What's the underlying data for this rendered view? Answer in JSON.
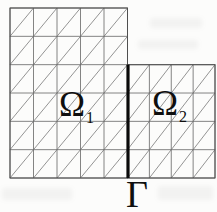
{
  "figure": {
    "canvas": {
      "width": 217,
      "height": 212
    },
    "colors": {
      "background": "#fcfcfb",
      "grid_line": "#646464",
      "diagonal_line": "#707070",
      "region_border": "#4f4f4f",
      "interface_line": "#0a0a0a",
      "label_text": "#0f0f0f"
    },
    "regions": [
      {
        "id": "omega1-mesh",
        "x": 10,
        "y": 8,
        "width": 117.5,
        "height": 170,
        "cols": 5,
        "rows": 6,
        "diagonal": "bl-tr"
      },
      {
        "id": "omega2-mesh",
        "x": 127.5,
        "y": 64.7,
        "width": 87.5,
        "height": 113.3,
        "cols": 4,
        "rows": 4,
        "diagonal": "bl-tr"
      }
    ],
    "interface": {
      "x": 128,
      "y1": 64.7,
      "y2": 178,
      "stroke_width": 3.2
    },
    "labels": {
      "omega1": {
        "base": "Ω",
        "sub": "1",
        "cx": 76,
        "cy": 104
      },
      "omega2": {
        "base": "Ω",
        "sub": "2",
        "cx": 169,
        "cy": 103
      },
      "gamma": {
        "text": "Γ",
        "cx": 137,
        "cy": 194
      }
    }
  }
}
